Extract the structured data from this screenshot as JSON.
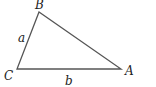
{
  "diagram": {
    "type": "triangle",
    "vertices": {
      "A": {
        "label": "A",
        "x": 121,
        "y": 69
      },
      "B": {
        "label": "B",
        "x": 39,
        "y": 12
      },
      "C": {
        "label": "C",
        "x": 17,
        "y": 69
      }
    },
    "sides": {
      "a": {
        "label": "a",
        "from": "C",
        "to": "B"
      },
      "b": {
        "label": "b",
        "from": "C",
        "to": "A"
      }
    },
    "stroke_color": "#555555"
  }
}
